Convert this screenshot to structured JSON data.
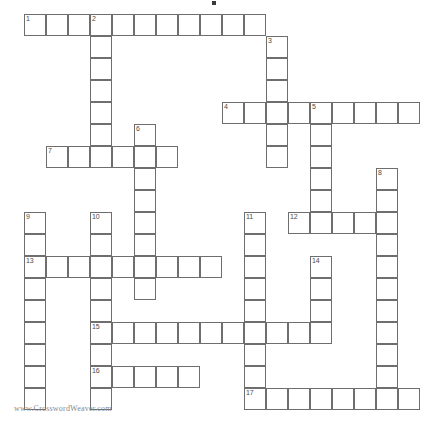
{
  "document": {
    "type": "crossword-puzzle-grid",
    "title": "",
    "footer_credit": "www.CrosswordWeaver.com",
    "grid": {
      "cell_size_px": 22,
      "origin_x_px": 24,
      "origin_y_px": 14,
      "columns": 18,
      "rows": 18,
      "line_color": "#6e6e6e",
      "cell_fill": "#ffffff",
      "number_color": "#4a4a4a"
    },
    "entries": [
      {
        "number": 1,
        "direction": "across",
        "col": 0,
        "row": 0,
        "length": 11
      },
      {
        "number": 2,
        "direction": "down",
        "col": 3,
        "row": 0,
        "length": 7
      },
      {
        "number": 3,
        "direction": "down",
        "col": 11,
        "row": 1,
        "length": 6
      },
      {
        "number": 4,
        "direction": "across",
        "col": 9,
        "row": 4,
        "length": 9
      },
      {
        "number": 5,
        "direction": "down",
        "col": 13,
        "row": 4,
        "length": 6
      },
      {
        "number": 6,
        "direction": "down",
        "col": 5,
        "row": 5,
        "length": 9
      },
      {
        "number": 7,
        "direction": "across",
        "col": 1,
        "row": 6,
        "length": 6
      },
      {
        "number": 8,
        "direction": "down",
        "col": 16,
        "row": 7,
        "length": 11
      },
      {
        "number": 9,
        "direction": "down",
        "col": 0,
        "row": 9,
        "length": 9
      },
      {
        "number": 10,
        "direction": "down",
        "col": 3,
        "row": 9,
        "length": 9
      },
      {
        "number": 11,
        "direction": "down",
        "col": 10,
        "row": 9,
        "length": 9
      },
      {
        "number": 12,
        "direction": "across",
        "col": 12,
        "row": 9,
        "length": 5
      },
      {
        "number": 13,
        "direction": "across",
        "col": 0,
        "row": 11,
        "length": 9
      },
      {
        "number": 14,
        "direction": "down",
        "col": 13,
        "row": 11,
        "length": 4
      },
      {
        "number": 15,
        "direction": "across",
        "col": 3,
        "row": 14,
        "length": 11
      },
      {
        "number": 16,
        "direction": "across",
        "col": 3,
        "row": 16,
        "length": 5
      },
      {
        "number": 17,
        "direction": "across",
        "col": 10,
        "row": 17,
        "length": 8
      }
    ],
    "cells": [
      {
        "col": 0,
        "row": 0,
        "number": "1"
      },
      {
        "col": 1,
        "row": 0,
        "number": ""
      },
      {
        "col": 2,
        "row": 0,
        "number": ""
      },
      {
        "col": 3,
        "row": 0,
        "number": "2"
      },
      {
        "col": 4,
        "row": 0,
        "number": ""
      },
      {
        "col": 5,
        "row": 0,
        "number": ""
      },
      {
        "col": 6,
        "row": 0,
        "number": ""
      },
      {
        "col": 7,
        "row": 0,
        "number": ""
      },
      {
        "col": 8,
        "row": 0,
        "number": ""
      },
      {
        "col": 9,
        "row": 0,
        "number": ""
      },
      {
        "col": 10,
        "row": 0,
        "number": ""
      },
      {
        "col": 11,
        "row": 1,
        "number": "3"
      },
      {
        "col": 3,
        "row": 1,
        "number": ""
      },
      {
        "col": 3,
        "row": 2,
        "number": ""
      },
      {
        "col": 11,
        "row": 2,
        "number": ""
      },
      {
        "col": 3,
        "row": 3,
        "number": ""
      },
      {
        "col": 11,
        "row": 3,
        "number": ""
      },
      {
        "col": 9,
        "row": 4,
        "number": "4"
      },
      {
        "col": 10,
        "row": 4,
        "number": ""
      },
      {
        "col": 11,
        "row": 4,
        "number": ""
      },
      {
        "col": 12,
        "row": 4,
        "number": ""
      },
      {
        "col": 13,
        "row": 4,
        "number": "5"
      },
      {
        "col": 14,
        "row": 4,
        "number": ""
      },
      {
        "col": 15,
        "row": 4,
        "number": ""
      },
      {
        "col": 16,
        "row": 4,
        "number": ""
      },
      {
        "col": 17,
        "row": 4,
        "number": ""
      },
      {
        "col": 3,
        "row": 4,
        "number": ""
      },
      {
        "col": 3,
        "row": 5,
        "number": ""
      },
      {
        "col": 5,
        "row": 5,
        "number": "6"
      },
      {
        "col": 11,
        "row": 5,
        "number": ""
      },
      {
        "col": 13,
        "row": 5,
        "number": ""
      },
      {
        "col": 1,
        "row": 6,
        "number": "7"
      },
      {
        "col": 2,
        "row": 6,
        "number": ""
      },
      {
        "col": 3,
        "row": 6,
        "number": ""
      },
      {
        "col": 4,
        "row": 6,
        "number": ""
      },
      {
        "col": 5,
        "row": 6,
        "number": ""
      },
      {
        "col": 6,
        "row": 6,
        "number": ""
      },
      {
        "col": 11,
        "row": 6,
        "number": ""
      },
      {
        "col": 13,
        "row": 6,
        "number": ""
      },
      {
        "col": 5,
        "row": 7,
        "number": ""
      },
      {
        "col": 13,
        "row": 7,
        "number": ""
      },
      {
        "col": 16,
        "row": 7,
        "number": "8"
      },
      {
        "col": 5,
        "row": 8,
        "number": ""
      },
      {
        "col": 13,
        "row": 8,
        "number": ""
      },
      {
        "col": 16,
        "row": 8,
        "number": ""
      },
      {
        "col": 0,
        "row": 9,
        "number": "9"
      },
      {
        "col": 3,
        "row": 9,
        "number": "10"
      },
      {
        "col": 5,
        "row": 9,
        "number": ""
      },
      {
        "col": 10,
        "row": 9,
        "number": "11"
      },
      {
        "col": 12,
        "row": 9,
        "number": "12"
      },
      {
        "col": 13,
        "row": 9,
        "number": ""
      },
      {
        "col": 14,
        "row": 9,
        "number": ""
      },
      {
        "col": 15,
        "row": 9,
        "number": ""
      },
      {
        "col": 16,
        "row": 9,
        "number": ""
      },
      {
        "col": 0,
        "row": 10,
        "number": ""
      },
      {
        "col": 3,
        "row": 10,
        "number": ""
      },
      {
        "col": 5,
        "row": 10,
        "number": ""
      },
      {
        "col": 10,
        "row": 10,
        "number": ""
      },
      {
        "col": 16,
        "row": 10,
        "number": ""
      },
      {
        "col": 0,
        "row": 11,
        "number": "13"
      },
      {
        "col": 1,
        "row": 11,
        "number": ""
      },
      {
        "col": 2,
        "row": 11,
        "number": ""
      },
      {
        "col": 3,
        "row": 11,
        "number": ""
      },
      {
        "col": 4,
        "row": 11,
        "number": ""
      },
      {
        "col": 5,
        "row": 11,
        "number": ""
      },
      {
        "col": 6,
        "row": 11,
        "number": ""
      },
      {
        "col": 7,
        "row": 11,
        "number": ""
      },
      {
        "col": 8,
        "row": 11,
        "number": ""
      },
      {
        "col": 10,
        "row": 11,
        "number": ""
      },
      {
        "col": 13,
        "row": 11,
        "number": "14"
      },
      {
        "col": 16,
        "row": 11,
        "number": ""
      },
      {
        "col": 0,
        "row": 12,
        "number": ""
      },
      {
        "col": 3,
        "row": 12,
        "number": ""
      },
      {
        "col": 5,
        "row": 12,
        "number": ""
      },
      {
        "col": 10,
        "row": 12,
        "number": ""
      },
      {
        "col": 13,
        "row": 12,
        "number": ""
      },
      {
        "col": 16,
        "row": 12,
        "number": ""
      },
      {
        "col": 0,
        "row": 13,
        "number": ""
      },
      {
        "col": 3,
        "row": 13,
        "number": ""
      },
      {
        "col": 10,
        "row": 13,
        "number": ""
      },
      {
        "col": 13,
        "row": 13,
        "number": ""
      },
      {
        "col": 16,
        "row": 13,
        "number": ""
      },
      {
        "col": 0,
        "row": 14,
        "number": ""
      },
      {
        "col": 3,
        "row": 14,
        "number": "15"
      },
      {
        "col": 4,
        "row": 14,
        "number": ""
      },
      {
        "col": 5,
        "row": 14,
        "number": ""
      },
      {
        "col": 6,
        "row": 14,
        "number": ""
      },
      {
        "col": 7,
        "row": 14,
        "number": ""
      },
      {
        "col": 8,
        "row": 14,
        "number": ""
      },
      {
        "col": 9,
        "row": 14,
        "number": ""
      },
      {
        "col": 10,
        "row": 14,
        "number": ""
      },
      {
        "col": 11,
        "row": 14,
        "number": ""
      },
      {
        "col": 12,
        "row": 14,
        "number": ""
      },
      {
        "col": 13,
        "row": 14,
        "number": ""
      },
      {
        "col": 16,
        "row": 14,
        "number": ""
      },
      {
        "col": 0,
        "row": 15,
        "number": ""
      },
      {
        "col": 3,
        "row": 15,
        "number": ""
      },
      {
        "col": 10,
        "row": 15,
        "number": ""
      },
      {
        "col": 16,
        "row": 15,
        "number": ""
      },
      {
        "col": 0,
        "row": 16,
        "number": ""
      },
      {
        "col": 3,
        "row": 16,
        "number": "16"
      },
      {
        "col": 4,
        "row": 16,
        "number": ""
      },
      {
        "col": 5,
        "row": 16,
        "number": ""
      },
      {
        "col": 6,
        "row": 16,
        "number": ""
      },
      {
        "col": 7,
        "row": 16,
        "number": ""
      },
      {
        "col": 10,
        "row": 16,
        "number": ""
      },
      {
        "col": 16,
        "row": 16,
        "number": ""
      },
      {
        "col": 0,
        "row": 17,
        "number": ""
      },
      {
        "col": 3,
        "row": 17,
        "number": ""
      },
      {
        "col": 10,
        "row": 17,
        "number": "17"
      },
      {
        "col": 11,
        "row": 17,
        "number": ""
      },
      {
        "col": 12,
        "row": 17,
        "number": ""
      },
      {
        "col": 13,
        "row": 17,
        "number": ""
      },
      {
        "col": 14,
        "row": 17,
        "number": ""
      },
      {
        "col": 15,
        "row": 17,
        "number": ""
      },
      {
        "col": 16,
        "row": 17,
        "number": ""
      },
      {
        "col": 17,
        "row": 17,
        "number": ""
      }
    ]
  }
}
